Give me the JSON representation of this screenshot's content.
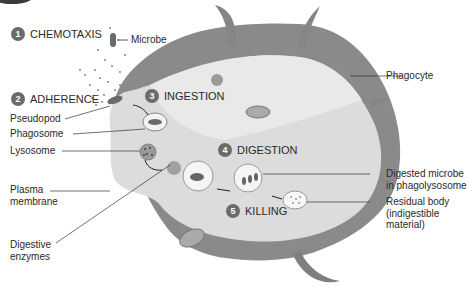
{
  "figure": {
    "type": "biology diagram",
    "colors": {
      "cell_outer": "#8a8a8a",
      "cell_outer_dark": "#6f6f6f",
      "cytoplasm": "#d9d9d9",
      "cytoplasm_light": "#e8e8e8",
      "step_badge": "#6b6b6b",
      "text": "#2a2a2a"
    }
  },
  "steps": [
    {
      "number": "1",
      "label": "CHEMOTAXIS"
    },
    {
      "number": "2",
      "label": "ADHERENCE"
    },
    {
      "number": "3",
      "label": "INGESTION"
    },
    {
      "number": "4",
      "label": "DIGESTION"
    },
    {
      "number": "5",
      "label": "KILLING"
    }
  ],
  "labels": {
    "microbe": "Microbe",
    "phagocyte": "Phagocyte",
    "pseudopod": "Pseudopod",
    "phagosome": "Phagosome",
    "lysosome": "Lysosome",
    "plasma_membrane_1": "Plasma",
    "plasma_membrane_2": "membrane",
    "digestive_enzymes_1": "Digestive",
    "digestive_enzymes_2": "enzymes",
    "digested_microbe_1": "Digested microbe",
    "digested_microbe_2": "in phagolysosome",
    "residual_body_1": "Residual body",
    "residual_body_2": "(indigestible",
    "residual_body_3": "material)"
  }
}
